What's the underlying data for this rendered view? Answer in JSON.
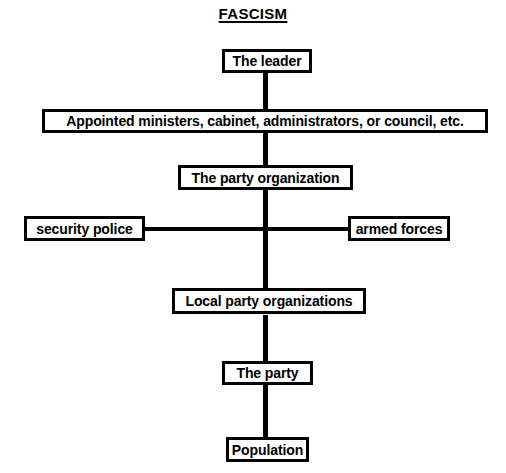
{
  "diagram": {
    "title": "FASCISM",
    "type": "hierarchy-chart",
    "background_color": "#ffffff",
    "line_color": "#000000",
    "nodes": [
      {
        "id": "leader",
        "label": "The leader"
      },
      {
        "id": "ministers",
        "label": "Appointed ministers, cabinet, administrators, or council, etc."
      },
      {
        "id": "party_org",
        "label": "The party organization"
      },
      {
        "id": "security",
        "label": "security police"
      },
      {
        "id": "armed",
        "label": "armed forces"
      },
      {
        "id": "local_org",
        "label": "Local party organizations"
      },
      {
        "id": "party",
        "label": "The party"
      },
      {
        "id": "population",
        "label": "Population"
      }
    ],
    "edges": [
      {
        "from": "leader",
        "to": "ministers"
      },
      {
        "from": "ministers",
        "to": "party_org"
      },
      {
        "from": "party_org",
        "to": "local_org"
      },
      {
        "from": "party_org",
        "to": "security"
      },
      {
        "from": "party_org",
        "to": "armed"
      },
      {
        "from": "local_org",
        "to": "party"
      },
      {
        "from": "party",
        "to": "population"
      }
    ]
  }
}
